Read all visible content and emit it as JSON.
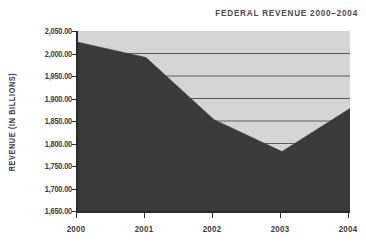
{
  "chart_data": {
    "type": "area",
    "title": "FEDERAL REVENUE 2000–2004",
    "xlabel": "",
    "ylabel": "REVENUE (IN BILLIONS)",
    "categories": [
      "2000",
      "2001",
      "2002",
      "2003",
      "2004"
    ],
    "values": [
      2025.0,
      1991.0,
      1853.0,
      1782.0,
      1878.0
    ],
    "series": [
      {
        "name": "Federal Revenue",
        "values": [
          2025.0,
          1991.0,
          1853.0,
          1782.0,
          1878.0
        ]
      }
    ],
    "ylim": [
      1650.0,
      2050.0
    ],
    "ytick_values": [
      1650.0,
      1700.0,
      1750.0,
      1800.0,
      1850.0,
      1900.0,
      1950.0,
      2000.0,
      2050.0
    ],
    "ytick_labels": [
      "1,650.00",
      "1,700.00",
      "1,750.00",
      "1,800.00",
      "1,850.00",
      "1,900.00",
      "1,950.00",
      "2,000.00",
      "2,050.00"
    ],
    "grid": true,
    "grid_axis": "y",
    "legend": "none",
    "colors": {
      "area_fill": "#3a3a3a",
      "plot_background": "#d5d5d5",
      "gridline": "#5d5d5d",
      "axis": "#2b2b2b",
      "text": "#3d3d3d",
      "title": "#4a4a4a"
    }
  }
}
